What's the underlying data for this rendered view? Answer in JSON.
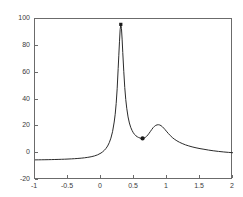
{
  "figure": {
    "background_color": "#ffffff",
    "axis_color": "#6b6b6b",
    "tick_text_color": "#3b3b3b",
    "curve_color": "#2b2b2b",
    "marker_color": "#1a1a1a"
  },
  "chart_data": {
    "type": "line",
    "title": "",
    "xlabel": "",
    "ylabel": "",
    "xlim": [
      -1,
      2
    ],
    "ylim": [
      -20,
      100
    ],
    "grid": false,
    "legend": null,
    "xticks": [
      -1,
      -0.5,
      0,
      0.5,
      1,
      1.5,
      2
    ],
    "xtick_labels": [
      "-1",
      "-0.5",
      "0",
      "0.5",
      "1",
      "1.5",
      "2"
    ],
    "yticks": [
      -20,
      0,
      20,
      40,
      60,
      80,
      100
    ],
    "ytick_labels": [
      "-20",
      "0",
      "20",
      "40",
      "60",
      "80",
      "100"
    ],
    "series": [
      {
        "name": "response",
        "style": "solid",
        "x": [
          -1.0,
          -0.95,
          -0.9,
          -0.85,
          -0.8,
          -0.75,
          -0.7,
          -0.65,
          -0.6,
          -0.55,
          -0.5,
          -0.45,
          -0.4,
          -0.35,
          -0.3,
          -0.25,
          -0.2,
          -0.15,
          -0.1,
          -0.05,
          0.0,
          0.025,
          0.05,
          0.075,
          0.1,
          0.125,
          0.15,
          0.175,
          0.2,
          0.215,
          0.23,
          0.245,
          0.26,
          0.27,
          0.28,
          0.29,
          0.3,
          0.31,
          0.32,
          0.33,
          0.345,
          0.36,
          0.375,
          0.39,
          0.41,
          0.43,
          0.45,
          0.47,
          0.49,
          0.51,
          0.53,
          0.55,
          0.57,
          0.59,
          0.61,
          0.63,
          0.65,
          0.67,
          0.69,
          0.71,
          0.73,
          0.75,
          0.77,
          0.79,
          0.81,
          0.83,
          0.85,
          0.87,
          0.89,
          0.91,
          0.93,
          0.95,
          0.97,
          0.99,
          1.02,
          1.05,
          1.08,
          1.11,
          1.15,
          1.19,
          1.23,
          1.28,
          1.33,
          1.38,
          1.44,
          1.5,
          1.56,
          1.63,
          1.7,
          1.78,
          1.86,
          1.93,
          2.0
        ],
        "y": [
          -5.0,
          -4.97,
          -4.93,
          -4.89,
          -4.84,
          -4.79,
          -4.73,
          -4.66,
          -4.58,
          -4.49,
          -4.38,
          -4.26,
          -4.11,
          -3.93,
          -3.72,
          -3.45,
          -3.11,
          -2.67,
          -2.07,
          -1.21,
          0.1,
          1.0,
          2.1,
          3.5,
          5.3,
          7.8,
          11.2,
          16.0,
          23.2,
          29.0,
          37.0,
          48.0,
          63.0,
          73.0,
          83.0,
          92.0,
          96.0,
          93.0,
          85.0,
          75.0,
          61.0,
          49.0,
          40.0,
          33.5,
          27.0,
          22.5,
          19.3,
          17.0,
          15.2,
          13.9,
          12.9,
          12.2,
          11.7,
          11.3,
          11.1,
          11.0,
          11.2,
          11.7,
          12.5,
          13.6,
          14.9,
          16.3,
          17.7,
          19.0,
          20.0,
          20.7,
          21.1,
          21.2,
          21.0,
          20.5,
          19.7,
          18.7,
          17.6,
          16.4,
          14.7,
          13.1,
          11.7,
          10.5,
          9.2,
          8.1,
          7.2,
          6.2,
          5.4,
          4.7,
          4.0,
          3.4,
          2.9,
          2.3,
          1.8,
          1.3,
          0.9,
          0.6,
          0.3
        ]
      }
    ],
    "markers": [
      {
        "name": "peak-marker",
        "x": 0.3,
        "y": 96.0,
        "shape": "square"
      },
      {
        "name": "valley-marker",
        "x": 0.63,
        "y": 11.0,
        "shape": "circle"
      }
    ],
    "annotations": []
  }
}
